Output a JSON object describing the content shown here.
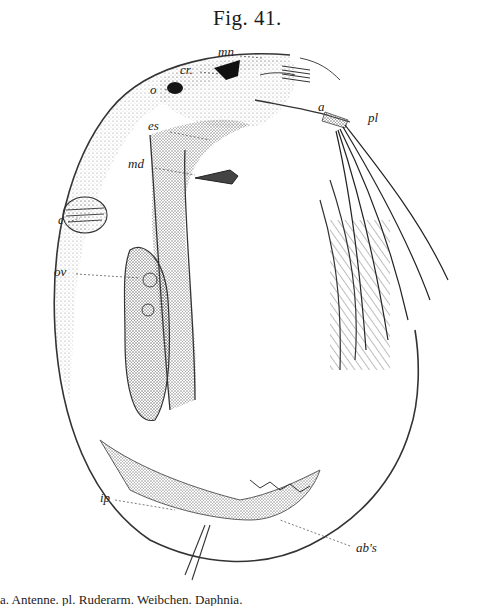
{
  "figure": {
    "title": "Fig. 41.",
    "labels": [
      {
        "id": "mn",
        "text": "mn",
        "x": 218,
        "y": 52
      },
      {
        "id": "cr",
        "text": "cr.",
        "x": 180,
        "y": 68
      },
      {
        "id": "o",
        "text": "o",
        "x": 157,
        "y": 87
      },
      {
        "id": "a",
        "text": "a",
        "x": 351,
        "y": 116
      },
      {
        "id": "pl",
        "text": "pl",
        "x": 372,
        "y": 120
      },
      {
        "id": "es",
        "text": "es",
        "x": 152,
        "y": 128
      },
      {
        "id": "md",
        "text": "md",
        "x": 130,
        "y": 165
      },
      {
        "id": "c",
        "text": "c",
        "x": 58,
        "y": 219
      },
      {
        "id": "ov",
        "text": "ov",
        "x": 56,
        "y": 271
      },
      {
        "id": "ip",
        "text": "ip",
        "x": 100,
        "y": 498
      },
      {
        "id": "abs",
        "text": "ab's",
        "x": 355,
        "y": 547
      }
    ],
    "caption": "a. Antenne. pl. Ruderarm. Weibchen. Daphnia."
  },
  "colors": {
    "ink": "#1a1a1a",
    "stipple": "#555555",
    "eye": "#111111",
    "paper": "#ffffff"
  }
}
